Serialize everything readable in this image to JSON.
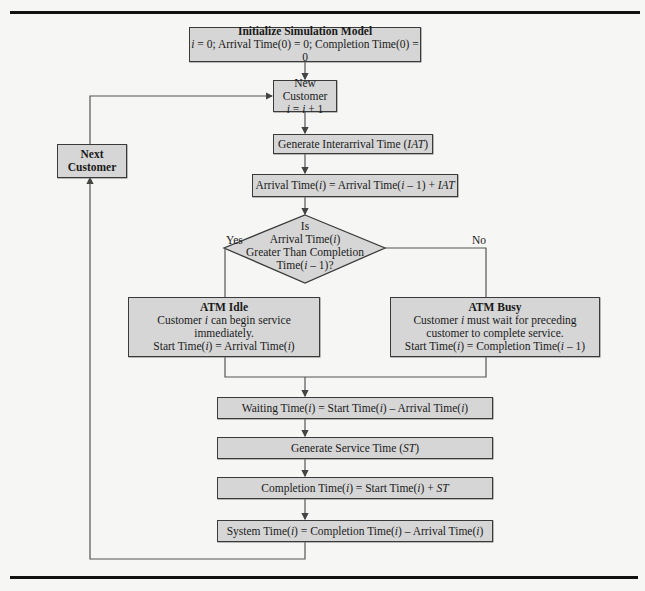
{
  "diagram": {
    "type": "flowchart",
    "nodes": {
      "init": {
        "title": "Initialize Simulation Model",
        "line1_var": "i",
        "line1": " = 0; Arrival Time(0) = 0; Completion Time(0) = 0"
      },
      "new_customer": {
        "title": "New Customer",
        "formula_a": "i",
        "formula_b": " = ",
        "formula_c": "i",
        "formula_d": " + 1"
      },
      "next_customer": {
        "line1": "Next",
        "line2": "Customer"
      },
      "gen_iat": {
        "text": "Generate Interarrival Time (",
        "var": "IAT",
        "close": ")"
      },
      "arrival": {
        "a": "Arrival Time(",
        "b": "i",
        "c": ") = Arrival Time(",
        "d": "i",
        "e": " – 1) + ",
        "f": "IAT"
      },
      "decision": {
        "line1": "Is",
        "line2a": "Arrival Time(",
        "line2b": "i",
        "line2c": ")",
        "line3": "Greater Than Completion",
        "line4a": "Time(",
        "line4b": "i",
        "line4c": " – 1)?"
      },
      "yes_label": "Yes",
      "no_label": "No",
      "atm_idle": {
        "title": "ATM Idle",
        "l1a": "Customer ",
        "l1b": "i",
        "l1c": " can begin service",
        "l2": "immediately.",
        "l3a": "Start Time(",
        "l3b": "i",
        "l3c": ") = Arrival Time(",
        "l3d": "i",
        "l3e": ")"
      },
      "atm_busy": {
        "title": "ATM Busy",
        "l1a": "Customer ",
        "l1b": "i",
        "l1c": " must wait for preceding",
        "l2": "customer to complete service.",
        "l3a": "Start Time(",
        "l3b": "i",
        "l3c": ") = Completion Time(",
        "l3d": "i",
        "l3e": " – 1)"
      },
      "waiting": {
        "a": "Waiting Time(",
        "b": "i",
        "c": ") = Start Time(",
        "d": "i",
        "e": ") – Arrival Time(",
        "f": "i",
        "g": ")"
      },
      "gen_st": {
        "text": "Generate Service Time (",
        "var": "ST",
        "close": ")"
      },
      "completion": {
        "a": "Completion Time(",
        "b": "i",
        "c": ") = Start Time(",
        "d": "i",
        "e": ") + ",
        "f": "ST"
      },
      "system": {
        "a": "System Time(",
        "b": "i",
        "c": ") = Completion Time(",
        "d": "i",
        "e": ") – Arrival Time(",
        "f": "i",
        "g": ")"
      }
    }
  }
}
